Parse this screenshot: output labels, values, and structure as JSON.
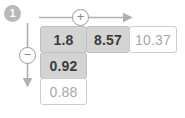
{
  "badge": {
    "label": "1",
    "name": "step-number"
  },
  "operators": {
    "horizontal": {
      "symbol": "+",
      "name": "addition"
    },
    "vertical": {
      "symbol": "−",
      "name": "subtraction"
    }
  },
  "grid": {
    "row_top": [
      {
        "value": "1.8",
        "state": "filled"
      },
      {
        "value": "8.57",
        "state": "filled"
      },
      {
        "value": "10.37",
        "state": "empty"
      }
    ],
    "column_left": [
      {
        "value": "0.92",
        "state": "filled"
      },
      {
        "value": "0.88",
        "state": "empty"
      }
    ]
  },
  "colors": {
    "filled_cell_bg": "#d4d4d4",
    "empty_cell_bg": "#ffffff",
    "cell_border": "#c9c9c9",
    "filled_text": "#3c3c3c",
    "empty_text": "#a8a8a8",
    "arrow": "#b0b0b0",
    "badge_bg": "#b9b9b9",
    "operator_stroke": "#9a9a9a"
  }
}
